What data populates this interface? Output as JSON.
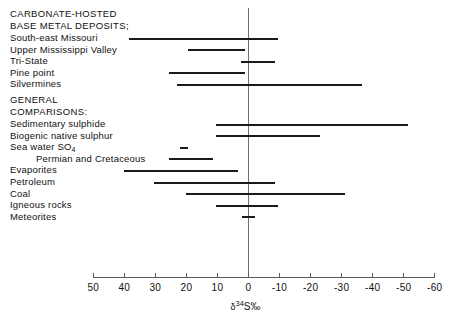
{
  "chart_data": {
    "type": "bar",
    "orientation": "horizontal-range",
    "title": "",
    "xlabel": "δ 34S‰",
    "ylabel": "",
    "xlim": [
      50,
      -60
    ],
    "xticks": [
      50,
      40,
      30,
      20,
      10,
      0,
      -10,
      -20,
      -30,
      -40,
      -50,
      -60
    ],
    "xtick_labels": [
      "50",
      "40",
      "30",
      "20",
      "10",
      "0",
      "-10",
      "-20",
      "-30",
      "-40",
      "-50",
      "-60"
    ],
    "grid": false,
    "legend": "none",
    "zero_reference_line": true,
    "groups": [
      {
        "heading_line1": "CARBONATE-HOSTED",
        "heading_line2": "BASE METAL DEPOSITS;",
        "rows": [
          {
            "label": "South-east Missouri",
            "min": -9.5,
            "max": 38.5
          },
          {
            "label": "Upper Mississippi Valley",
            "min": 1.0,
            "max": 19.5
          },
          {
            "label": "Tri-State",
            "min": -8.5,
            "max": 2.5
          },
          {
            "label": "Pine point",
            "min": 1.0,
            "max": 25.5
          },
          {
            "label": "Silvermines",
            "min": -36.5,
            "max": 23.0
          }
        ]
      },
      {
        "heading_line1": "GENERAL",
        "heading_line2": "COMPARISONS:",
        "rows": [
          {
            "label": "Sedimentary sulphide",
            "min": -51.5,
            "max": 10.5
          },
          {
            "label": "Biogenic native sulphur",
            "min": -23.0,
            "max": 10.5
          },
          {
            "label": "Sea water SO4",
            "min": 19.5,
            "max": 22.0,
            "sub": "4",
            "label_main": "Sea water SO"
          },
          {
            "label": "Permian and Cretaceous",
            "min": 11.5,
            "max": 25.5,
            "indent": true
          },
          {
            "label": "Evaporites",
            "min": 3.5,
            "max": 40.0
          },
          {
            "label": "Petroleum",
            "min": -8.5,
            "max": 30.5
          },
          {
            "label": "Coal",
            "min": -31.0,
            "max": 20.0
          },
          {
            "label": "Igneous rocks",
            "min": -9.5,
            "max": 10.5
          },
          {
            "label": "Meteorites",
            "min": -2.0,
            "max": 2.0
          }
        ]
      }
    ]
  },
  "axis": {
    "title_delta": "δ",
    "title_sup": "34",
    "title_rest": "S‰"
  }
}
